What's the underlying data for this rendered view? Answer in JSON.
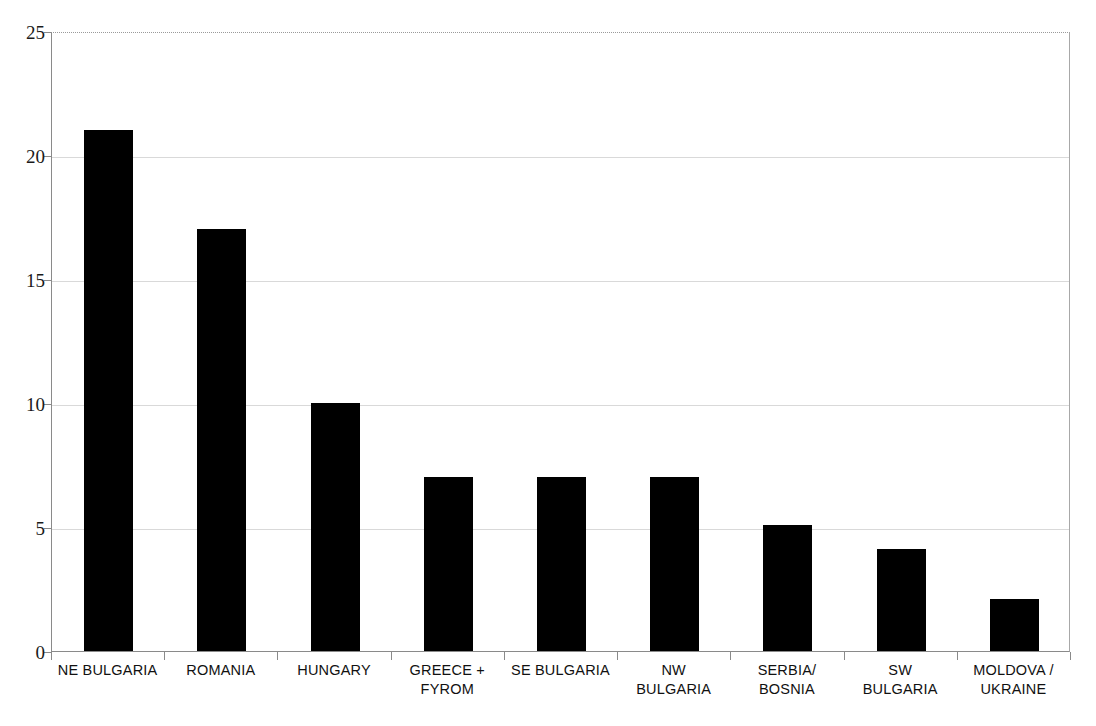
{
  "chart_data": {
    "type": "bar",
    "title": "",
    "subtitle": "",
    "xlabel": "",
    "ylabel": "",
    "ylim": [
      0,
      25
    ],
    "ytick_values": [
      0,
      5,
      10,
      15,
      20,
      25
    ],
    "ytick_labels": [
      "0",
      "5",
      "10",
      "15",
      "20",
      "25"
    ],
    "grid": "horizontal",
    "legend": "none",
    "bar_color": "#000000",
    "categories": [
      "NE BULGARIA",
      "ROMANIA",
      "HUNGARY",
      "GREECE + FYROM",
      "SE BULGARIA",
      "NW BULGARIA",
      "SERBIA/ BOSNIA",
      "SW BULGARIA",
      "MOLDOVA / UKRAINE"
    ],
    "category_label_lines": [
      [
        "NE BULGARIA"
      ],
      [
        "ROMANIA"
      ],
      [
        "HUNGARY"
      ],
      [
        "GREECE +",
        "FYROM"
      ],
      [
        "SE BULGARIA"
      ],
      [
        "NW",
        "BULGARIA"
      ],
      [
        "SERBIA/",
        "BOSNIA"
      ],
      [
        "SW",
        "BULGARIA"
      ],
      [
        "MOLDOVA /",
        "UKRAINE"
      ]
    ],
    "values": [
      21,
      17,
      10,
      7,
      7,
      7,
      5.1,
      4.1,
      2.1
    ]
  },
  "colors": {
    "bar": "#000000",
    "axis": "#8a8a8a",
    "gridline": "#d9d9d9",
    "text": "#111111",
    "background": "#ffffff"
  }
}
